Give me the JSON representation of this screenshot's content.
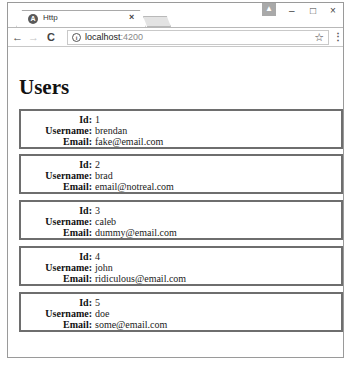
{
  "browser": {
    "tab": {
      "title": "Http",
      "favicon": "angular-icon",
      "close_glyph": "×"
    },
    "window_controls": {
      "minimize": "–",
      "maximize": "□",
      "close": "×"
    },
    "profile_glyph": "▲",
    "nav": {
      "back": "←",
      "forward": "→",
      "reload": "C"
    },
    "address": {
      "host": "localhost",
      "port": ":4200",
      "info_glyph": "i"
    },
    "star_glyph": "☆",
    "menu_glyph": "⋮"
  },
  "page": {
    "title": "Users",
    "labels": {
      "id": "Id:",
      "username": "Username:",
      "email": "Email:"
    },
    "users": [
      {
        "id": "1",
        "username": "brendan",
        "email": "fake@email.com"
      },
      {
        "id": "2",
        "username": "brad",
        "email": "email@notreal.com"
      },
      {
        "id": "3",
        "username": "caleb",
        "email": "dummy@email.com"
      },
      {
        "id": "4",
        "username": "john",
        "email": "ridiculous@email.com"
      },
      {
        "id": "5",
        "username": "doe",
        "email": "some@email.com"
      }
    ]
  }
}
